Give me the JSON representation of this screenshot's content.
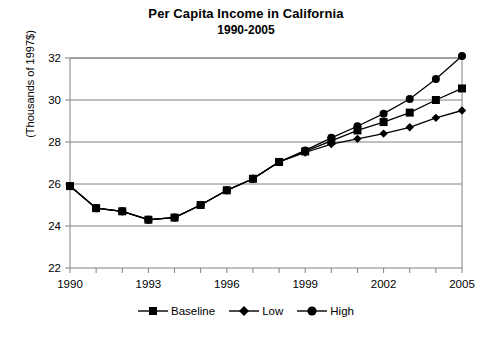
{
  "chart_data": {
    "type": "line",
    "title": "Per Capita Income in California",
    "subtitle": "1990-2005",
    "xlabel": "",
    "ylabel": "(Thousands of 1997$)",
    "x": [
      1990,
      1991,
      1992,
      1993,
      1994,
      1995,
      1996,
      1997,
      1998,
      1999,
      2000,
      2001,
      2002,
      2003,
      2004,
      2005
    ],
    "xlim": [
      1990,
      2005
    ],
    "ylim": [
      22,
      32
    ],
    "ytick_labels": [
      "22",
      "24",
      "26",
      "28",
      "30",
      "32"
    ],
    "yticks": [
      22,
      24,
      26,
      28,
      30,
      32
    ],
    "xtick_labels": [
      "1990",
      "1993",
      "1996",
      "1999",
      "2002",
      "2005"
    ],
    "xticks": [
      1990,
      1993,
      1996,
      1999,
      2002,
      2005
    ],
    "xtick_minor_every": 1,
    "grid": "horizontal",
    "legend_position": "bottom-center",
    "series": [
      {
        "name": "Baseline",
        "marker": "square",
        "color": "#000000",
        "values": [
          25.9,
          24.85,
          24.7,
          24.3,
          24.4,
          25.0,
          25.7,
          26.25,
          27.05,
          27.55,
          28.05,
          28.55,
          28.95,
          29.4,
          30.0,
          30.55
        ]
      },
      {
        "name": "Low",
        "marker": "diamond",
        "color": "#000000",
        "values": [
          25.9,
          24.85,
          24.7,
          24.3,
          24.4,
          25.0,
          25.7,
          26.25,
          27.05,
          27.5,
          27.9,
          28.15,
          28.4,
          28.7,
          29.15,
          29.5
        ]
      },
      {
        "name": "High",
        "marker": "circle",
        "color": "#000000",
        "values": [
          25.9,
          24.85,
          24.7,
          24.3,
          24.4,
          25.0,
          25.7,
          26.25,
          27.05,
          27.6,
          28.2,
          28.75,
          29.35,
          30.05,
          31.0,
          32.1
        ]
      }
    ]
  },
  "legend": {
    "items": [
      {
        "label": "Baseline",
        "marker": "square"
      },
      {
        "label": "Low",
        "marker": "diamond"
      },
      {
        "label": "High",
        "marker": "circle"
      }
    ]
  },
  "colors": {
    "line": "#000000",
    "grid": "#808080",
    "axis": "#808080",
    "background": "#ffffff"
  }
}
